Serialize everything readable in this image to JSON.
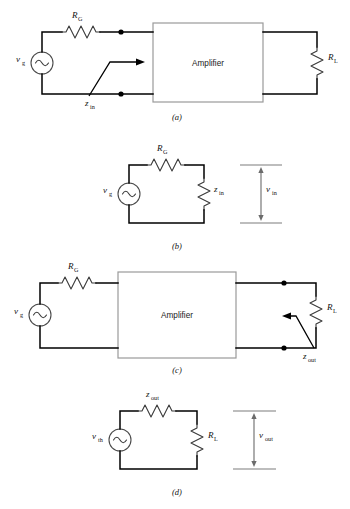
{
  "figure": {
    "background_color": "#ffffff",
    "wire_color": "#000000",
    "component_color": "#3a3a3a",
    "amplifier_box_color": "#9a9a9a",
    "measure_color": "#7d7d7d"
  },
  "panels": [
    {
      "id": "a",
      "caption": "(a)",
      "description": "Generator with series resistance driving amplifier input; z_in looking into amplifier input terminals, amplifier output drives load R_L",
      "labels": {
        "source": {
          "base": "v",
          "sub": "g"
        },
        "series_resistor": {
          "base": "R",
          "sub": "G"
        },
        "amplifier": "Amplifier",
        "input_impedance": {
          "base": "z",
          "sub": "in"
        },
        "load_resistor": {
          "base": "R",
          "sub": "L"
        }
      }
    },
    {
      "id": "b",
      "caption": "(b)",
      "description": "Thevenin input-side equivalent: v_g source with R_G in series feeding z_in; v_in measured across z_in",
      "labels": {
        "source": {
          "base": "v",
          "sub": "g"
        },
        "series_resistor": {
          "base": "R",
          "sub": "G"
        },
        "input_impedance": {
          "base": "z",
          "sub": "in"
        },
        "input_voltage": {
          "base": "v",
          "sub": "in"
        }
      }
    },
    {
      "id": "c",
      "caption": "(c)",
      "description": "Generator driving amplifier; z_out looking back into amplifier output terminals, with load R_L attached",
      "labels": {
        "source": {
          "base": "v",
          "sub": "g"
        },
        "series_resistor": {
          "base": "R",
          "sub": "G"
        },
        "amplifier": "Amplifier",
        "output_impedance": {
          "base": "z",
          "sub": "out"
        },
        "load_resistor": {
          "base": "R",
          "sub": "L"
        }
      }
    },
    {
      "id": "d",
      "caption": "(d)",
      "description": "Thevenin output-side equivalent: v_th source with z_out in series feeding R_L; v_out measured across R_L",
      "labels": {
        "source": {
          "base": "v",
          "sub": "th"
        },
        "series_impedance": {
          "base": "z",
          "sub": "out"
        },
        "load_resistor": {
          "base": "R",
          "sub": "L"
        },
        "output_voltage": {
          "base": "v",
          "sub": "out"
        }
      }
    }
  ]
}
